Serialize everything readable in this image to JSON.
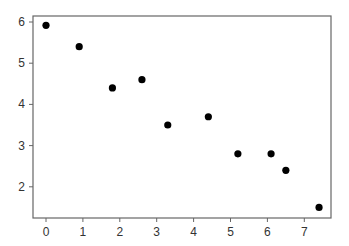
{
  "chart_data": {
    "type": "scatter",
    "title": "",
    "xlabel": "",
    "ylabel": "",
    "xlim": [
      -0.35,
      7.7
    ],
    "ylim": [
      1.25,
      6.15
    ],
    "grid": false,
    "legend": null,
    "x_ticks": [
      0,
      1,
      2,
      3,
      4,
      5,
      6,
      7
    ],
    "y_ticks": [
      2,
      3,
      4,
      5,
      6
    ],
    "series": [
      {
        "name": "points",
        "color": "#000000",
        "x": [
          0,
          0.9,
          1.8,
          2.6,
          3.3,
          4.4,
          5.2,
          6.1,
          6.5,
          7.4
        ],
        "y": [
          5.92,
          5.4,
          4.4,
          4.6,
          3.5,
          3.7,
          2.8,
          2.8,
          2.4,
          1.5
        ]
      }
    ]
  },
  "style": {
    "axis_color": "#666666",
    "point_color": "#000000",
    "text_color": "#333333"
  }
}
